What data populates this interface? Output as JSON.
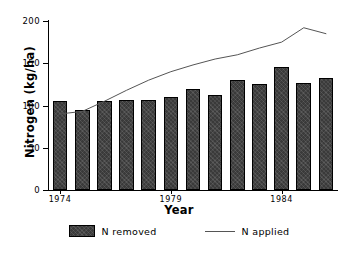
{
  "chart_data": {
    "type": "bar",
    "title": "",
    "xlabel": "Year",
    "ylabel": "Nitrogen (kg/ha)",
    "categories": [
      "1974",
      "1975",
      "1976",
      "1977",
      "1978",
      "1979",
      "1980",
      "1981",
      "1982",
      "1983",
      "1984",
      "1985",
      "1986"
    ],
    "xtick_labels": [
      "1974",
      "1979",
      "1984"
    ],
    "xtick_categories": [
      "1974",
      "1979",
      "1984"
    ],
    "ytick_labels": [
      "0",
      "50",
      "100",
      "150",
      "200"
    ],
    "ytick_values": [
      0,
      50,
      100,
      150,
      200
    ],
    "ylim": [
      0,
      200
    ],
    "grid": false,
    "legend_position": "bottom",
    "series": [
      {
        "name": "N removed",
        "type": "bar",
        "color": "#3a3a3a",
        "values": [
          105,
          95,
          105,
          106,
          107,
          110,
          120,
          112,
          130,
          125,
          146,
          127,
          132
        ]
      },
      {
        "name": "N applied",
        "type": "line",
        "color": "#555555",
        "values": [
          90,
          93,
          105,
          118,
          130,
          140,
          148,
          155,
          160,
          168,
          175,
          192,
          185
        ]
      }
    ]
  },
  "legend": {
    "items": [
      {
        "label": "N removed",
        "marker": "swatch"
      },
      {
        "label": "N applied",
        "marker": "line"
      }
    ]
  }
}
